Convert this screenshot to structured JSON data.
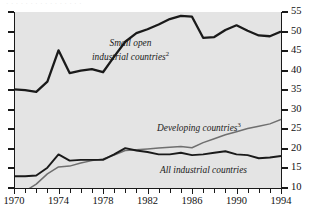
{
  "figure": {
    "cut_caption": "· · · · · · · · · · · · · · · ·",
    "background": "#e4e4e4",
    "line_color_dark": "#1a1a1a",
    "line_color_gray": "#6f6f6f"
  },
  "chart_data": {
    "type": "line",
    "title": "",
    "subtitle": "",
    "xlabel": "",
    "ylabel": "",
    "xlim": [
      1970,
      1994
    ],
    "ylim": [
      10,
      55
    ],
    "grid": false,
    "legend": "inline-annotations",
    "y_ticks": [
      10,
      15,
      20,
      25,
      30,
      35,
      40,
      45,
      50,
      55
    ],
    "y_tick_labels": [
      "10",
      "15",
      "20",
      "25",
      "30",
      "35",
      "40",
      "45",
      "50",
      "55"
    ],
    "x_ticks": [
      1970,
      1971,
      1972,
      1973,
      1974,
      1975,
      1976,
      1977,
      1978,
      1979,
      1980,
      1981,
      1982,
      1983,
      1984,
      1985,
      1986,
      1987,
      1988,
      1989,
      1990,
      1991,
      1992,
      1993,
      1994
    ],
    "x_tick_labels_major": [
      "1970",
      "1974",
      "1978",
      "1982",
      "1986",
      "1990",
      "1994"
    ],
    "x_major_years": [
      1970,
      1974,
      1978,
      1982,
      1986,
      1990,
      1994
    ],
    "x": [
      1970,
      1971,
      1972,
      1973,
      1974,
      1975,
      1976,
      1977,
      1978,
      1979,
      1980,
      1981,
      1982,
      1983,
      1984,
      1985,
      1986,
      1987,
      1988,
      1989,
      1990,
      1991,
      1992,
      1993,
      1994
    ],
    "series": [
      {
        "name": "Small open industrial countries",
        "footnote": "2",
        "label": "Small open\nindustrial countries",
        "label_line1": "Small open",
        "label_line2": "industrial countries",
        "color": "#1a1a1a",
        "width": 2.3,
        "values": [
          35.2,
          35.0,
          34.6,
          37.2,
          45.2,
          39.4,
          40.0,
          40.4,
          39.6,
          43.6,
          47.4,
          49.6,
          50.6,
          51.8,
          53.2,
          54.0,
          53.8,
          48.4,
          48.6,
          50.4,
          51.6,
          50.2,
          49.0,
          48.8,
          50.0
        ]
      },
      {
        "name": "Developing countries",
        "footnote": "3",
        "label": "Developing countries",
        "color": "#6f6f6f",
        "width": 1.5,
        "values": [
          9.0,
          9.2,
          11.0,
          13.6,
          15.4,
          15.6,
          16.4,
          17.0,
          17.4,
          18.4,
          19.6,
          19.8,
          20.0,
          20.2,
          20.4,
          20.6,
          20.3,
          21.6,
          22.6,
          23.6,
          24.4,
          25.2,
          25.8,
          26.4,
          27.5
        ]
      },
      {
        "name": "All industrial countries",
        "footnote": "",
        "label": "All industrial countries",
        "color": "#1a1a1a",
        "width": 1.9,
        "values": [
          13.0,
          13.0,
          13.2,
          15.2,
          18.6,
          17.0,
          17.2,
          17.2,
          17.2,
          18.6,
          20.2,
          19.6,
          19.2,
          18.6,
          18.6,
          19.0,
          18.4,
          18.6,
          19.0,
          19.4,
          18.6,
          18.4,
          17.6,
          17.8,
          18.2
        ]
      }
    ],
    "annotations": [
      {
        "text": "Small open industrial countries2",
        "x": 1980.5,
        "y": 44.5
      },
      {
        "text": "Developing countries3",
        "x": 1985.0,
        "y": 26.0
      },
      {
        "text": "All industrial countries",
        "x": 1987.5,
        "y": 15.6
      }
    ]
  }
}
